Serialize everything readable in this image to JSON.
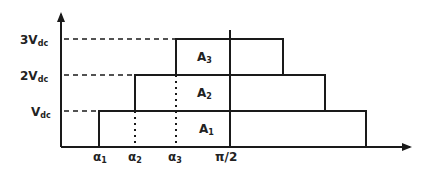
{
  "diagram": {
    "y_levels": [
      {
        "id": "vdc",
        "coef": "",
        "base": "V",
        "sub": "dc",
        "level": 1
      },
      {
        "id": "2vdc",
        "coef": "2",
        "base": "V",
        "sub": "dc",
        "level": 2
      },
      {
        "id": "3vdc",
        "coef": "3",
        "base": "V",
        "sub": "dc",
        "level": 3
      }
    ],
    "x_labels": [
      {
        "id": "alpha1",
        "base": "α",
        "sub": "1"
      },
      {
        "id": "alpha2",
        "base": "α",
        "sub": "2"
      },
      {
        "id": "alpha3",
        "base": "α",
        "sub": "3"
      },
      {
        "id": "pi-half",
        "base": "π/2",
        "sub": ""
      }
    ],
    "areas": [
      {
        "id": "A1",
        "base": "A",
        "sub": "1",
        "level": 1
      },
      {
        "id": "A2",
        "base": "A",
        "sub": "2",
        "level": 2
      },
      {
        "id": "A3",
        "base": "A",
        "sub": "3",
        "level": 3
      }
    ],
    "colors": {
      "line": "#1a1a1a",
      "text": "#222222",
      "background": "#ffffff"
    }
  }
}
